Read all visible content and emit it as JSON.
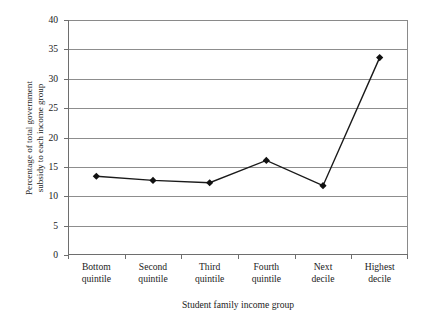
{
  "chart_data": {
    "type": "line",
    "title": "",
    "xlabel": "Student family income group",
    "ylabel": "Percentage of total government subsidy to each income group",
    "ylabel_line1": "Percentage of total government",
    "ylabel_line2": "subsidy to each income group",
    "categories": [
      "Bottom quintile",
      "Second quintile",
      "Third quintile",
      "Fourth quintile",
      "Next decile",
      "Highest decile"
    ],
    "category_lines": [
      [
        "Bottom",
        "quintile"
      ],
      [
        "Second",
        "quintile"
      ],
      [
        "Third",
        "quintile"
      ],
      [
        "Fourth",
        "quintile"
      ],
      [
        "Next",
        "decile"
      ],
      [
        "Highest",
        "decile"
      ]
    ],
    "values": [
      13.4,
      12.7,
      12.3,
      16.1,
      11.8,
      33.6
    ],
    "ylim": [
      0,
      40
    ],
    "yticks": [
      0,
      5,
      10,
      15,
      20,
      25,
      30,
      35,
      40
    ],
    "ytick_labels": [
      "0",
      "5",
      "10",
      "15",
      "20",
      "25",
      "30",
      "35",
      "40"
    ],
    "grid": "horizontal",
    "legend": "none",
    "marker": "diamond",
    "line_color": "#1a1a1a",
    "marker_color": "#111111",
    "grid_color": "#8d8d8d",
    "axis_color": "#6e6e6e"
  }
}
